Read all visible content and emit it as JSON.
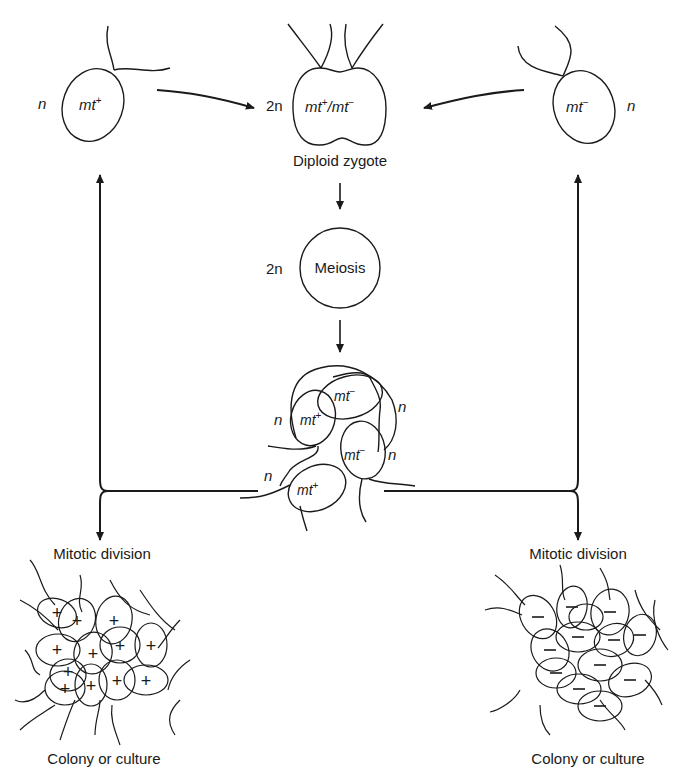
{
  "diagram": {
    "top_left_cell": {
      "ploidy": "n",
      "mating_type": "mt",
      "sign": "+"
    },
    "top_right_cell": {
      "ploidy": "n",
      "mating_type": "mt",
      "sign": "−"
    },
    "zygote": {
      "ploidy": "2n",
      "label_a": "mt",
      "sign_a": "+",
      "sep": "/",
      "label_b": "mt",
      "sign_b": "−",
      "caption": "Diploid zygote"
    },
    "meiosis": {
      "ploidy": "2n",
      "label": "Meiosis"
    },
    "tetrad": {
      "cells": [
        {
          "ploidy": "n",
          "mating_type": "mt",
          "sign": "+"
        },
        {
          "ploidy": "n",
          "mating_type": "mt",
          "sign": "−"
        },
        {
          "ploidy": "n",
          "mating_type": "mt",
          "sign": "−"
        },
        {
          "ploidy": "n",
          "mating_type": "mt",
          "sign": "+"
        }
      ]
    },
    "left_branch": {
      "step": "Mitotic division",
      "result": "Colony or culture",
      "cell_sign": "+"
    },
    "right_branch": {
      "step": "Mitotic division",
      "result": "Colony or culture",
      "cell_sign": "−"
    },
    "colors": {
      "line": "#1a1a1a",
      "background": "#ffffff"
    }
  }
}
